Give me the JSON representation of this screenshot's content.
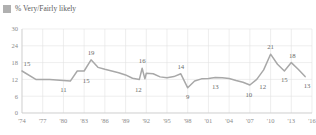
{
  "legend": {
    "label": "% Very/Fairly likely",
    "swatch_color": "#b0b0b0",
    "icon": "square-swatch-icon"
  },
  "colors": {
    "line": "#a8a8a8",
    "grid": "#e3e3e3",
    "axis": "#c9c9c9",
    "text": "#6e6e6e"
  },
  "chart_data": {
    "type": "line",
    "title": "",
    "subtitle": "",
    "xlabel": "",
    "ylabel": "",
    "ylim": [
      0,
      30
    ],
    "xlim": [
      1974,
      2016
    ],
    "grid": true,
    "legend_position": "top-left",
    "yticks": [
      0,
      6,
      12,
      18,
      24,
      30
    ],
    "ytick_labels": [
      "0",
      "6",
      "12",
      "18",
      "24",
      "30"
    ],
    "xticks": [
      1974,
      1977,
      1980,
      1983,
      1986,
      1989,
      1992,
      1995,
      1998,
      2001,
      2004,
      2007,
      2010,
      2013,
      2016
    ],
    "xtick_labels": [
      "'74",
      "'77",
      "'80",
      "'83",
      "'86",
      "'89",
      "'92",
      "'95",
      "'98",
      "'01",
      "'04",
      "'07",
      "'10",
      "'13",
      "'16"
    ],
    "series": [
      {
        "name": "% Very/Fairly likely",
        "color": "#a8a8a8",
        "x": [
          1974,
          1976,
          1978,
          1980,
          1981,
          1982,
          1983,
          1984,
          1985,
          1986,
          1987,
          1988,
          1989,
          1990,
          1991,
          1991.4,
          1991.8,
          1992,
          1993,
          1994,
          1995,
          1996,
          1997,
          1998,
          1999,
          2000,
          2001,
          2002,
          2003,
          2004,
          2005,
          2006,
          2007,
          2008,
          2009,
          2010,
          2011,
          2012,
          2013,
          2014,
          2015
        ],
        "values": [
          15,
          12,
          12,
          11.6,
          11.4,
          15,
          15,
          19,
          16.3,
          15.6,
          15,
          14.4,
          13.6,
          12.4,
          12,
          16,
          12.2,
          14.2,
          14,
          12.9,
          12.6,
          13,
          14,
          9,
          11.4,
          12.2,
          12.3,
          12.7,
          12.6,
          12.3,
          11.6,
          11,
          10,
          12,
          15.4,
          21,
          17.4,
          15,
          18,
          15.6,
          13
        ]
      }
    ],
    "point_labels": [
      {
        "label": "15",
        "x": 1974,
        "y": 15,
        "dx": 5,
        "dy": -5
      },
      {
        "label": "11",
        "x": 1980,
        "y": 11.6,
        "dx": 0,
        "dy": 11
      },
      {
        "label": "19",
        "x": 1984,
        "y": 19,
        "dx": 0,
        "dy": -5
      },
      {
        "label": "15",
        "x": 1983,
        "y": 15,
        "dx": 2,
        "dy": 12
      },
      {
        "label": "16",
        "x": 1991.4,
        "y": 16,
        "dx": 0,
        "dy": -5
      },
      {
        "label": "12",
        "x": 1991,
        "y": 12,
        "dx": -1,
        "dy": 13
      },
      {
        "label": "14",
        "x": 1997,
        "y": 14,
        "dx": 0,
        "dy": -5
      },
      {
        "label": "9",
        "x": 1998,
        "y": 9,
        "dx": 0,
        "dy": 11
      },
      {
        "label": "13",
        "x": 2002,
        "y": 12.7,
        "dx": 0,
        "dy": 12
      },
      {
        "label": "10",
        "x": 2007,
        "y": 10,
        "dx": -1,
        "dy": 12
      },
      {
        "label": "12",
        "x": 2008,
        "y": 12,
        "dx": 6,
        "dy": 10
      },
      {
        "label": "21",
        "x": 2010,
        "y": 21,
        "dx": 0,
        "dy": -5
      },
      {
        "label": "15",
        "x": 2012,
        "y": 15,
        "dx": 0,
        "dy": 11
      },
      {
        "label": "18",
        "x": 2013,
        "y": 18,
        "dx": 1,
        "dy": -5
      },
      {
        "label": "13",
        "x": 2015,
        "y": 13,
        "dx": 2,
        "dy": 11
      }
    ]
  }
}
